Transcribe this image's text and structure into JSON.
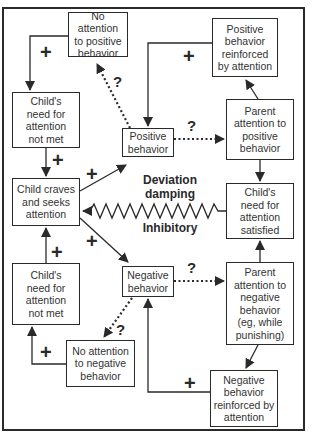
{
  "diagram": {
    "type": "feedback-loop",
    "nodes": {
      "no_attention_positive": "No attention\nto positive\nbehavior",
      "positive_reinforced": "Positive\nbehavior\nreinforced\nby attention",
      "need_not_met_top": "Child's\nneed for\nattention\nnot met",
      "positive_behavior": "Positive\nbehavior",
      "parent_attention_positive": "Parent\nattention to\npositive\nbehavior",
      "child_craves": "Child craves\nand seeks\nattention",
      "need_satisfied": "Child's\nneed for\nattention\nsatisfied",
      "need_not_met_bottom": "Child's\nneed for\nattention\nnot met",
      "negative_behavior": "Negative\nbehavior",
      "parent_attention_negative": "Parent\nattention to\nnegative\nbehavior\n(eg, while\npunishing)",
      "no_attention_negative": "No attention\nto negative\nbehavior",
      "negative_reinforced": "Negative\nbehavior\nreinforced by\nattention"
    },
    "center_labels": {
      "deviation": "Deviation\ndamping",
      "inhibitory": "Inhibitory"
    },
    "signs": {
      "plus": "+",
      "question": "?"
    },
    "edges": [
      {
        "from": "no_attention_positive",
        "to": "need_not_met_top",
        "sign": "+",
        "style": "solid"
      },
      {
        "from": "need_not_met_top",
        "to": "child_craves",
        "sign": "+",
        "style": "solid"
      },
      {
        "from": "child_craves",
        "to": "positive_behavior",
        "sign": "+",
        "style": "solid"
      },
      {
        "from": "child_craves",
        "to": "negative_behavior",
        "sign": "+",
        "style": "solid"
      },
      {
        "from": "positive_behavior",
        "to": "no_attention_positive",
        "sign": "?",
        "style": "dotted"
      },
      {
        "from": "positive_behavior",
        "to": "parent_attention_positive",
        "sign": "?",
        "style": "dotted"
      },
      {
        "from": "parent_attention_positive",
        "to": "positive_reinforced",
        "sign": "",
        "style": "solid"
      },
      {
        "from": "positive_reinforced",
        "to": "positive_behavior",
        "sign": "+",
        "style": "solid"
      },
      {
        "from": "parent_attention_positive",
        "to": "need_satisfied",
        "sign": "",
        "style": "solid"
      },
      {
        "from": "need_satisfied",
        "to": "child_craves",
        "sign": "",
        "style": "zigzag-inhibitory"
      },
      {
        "from": "negative_behavior",
        "to": "parent_attention_negative",
        "sign": "?",
        "style": "dotted"
      },
      {
        "from": "parent_attention_negative",
        "to": "need_satisfied",
        "sign": "",
        "style": "solid"
      },
      {
        "from": "parent_attention_negative",
        "to": "negative_reinforced",
        "sign": "",
        "style": "solid"
      },
      {
        "from": "negative_reinforced",
        "to": "negative_behavior",
        "sign": "+",
        "style": "solid"
      },
      {
        "from": "negative_behavior",
        "to": "no_attention_negative",
        "sign": "?",
        "style": "dotted"
      },
      {
        "from": "no_attention_negative",
        "to": "need_not_met_bottom",
        "sign": "+",
        "style": "solid"
      },
      {
        "from": "need_not_met_bottom",
        "to": "child_craves",
        "sign": "+",
        "style": "solid"
      }
    ]
  }
}
